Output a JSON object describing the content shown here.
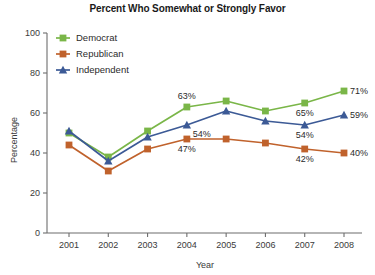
{
  "chart_data": {
    "type": "line",
    "title": "Percent Who Somewhat or Strongly Favor",
    "xlabel": "Year",
    "ylabel": "Percentage",
    "categories": [
      "2001",
      "2002",
      "2003",
      "2004",
      "2005",
      "2006",
      "2007",
      "2008"
    ],
    "x": [
      2001,
      2002,
      2003,
      2004,
      2005,
      2006,
      2007,
      2008
    ],
    "ylim": [
      0,
      100
    ],
    "yticks": [
      0,
      20,
      40,
      60,
      80,
      100
    ],
    "ytick_labels": [
      "0",
      "20",
      "40",
      "60",
      "80",
      "100"
    ],
    "grid": false,
    "legend_position": "upper-left-inside",
    "series": [
      {
        "name": "Democrat",
        "color": "#7ab648",
        "marker": "square",
        "values": [
          50,
          38,
          51,
          63,
          66,
          61,
          65,
          71
        ]
      },
      {
        "name": "Republican",
        "color": "#c0622c",
        "marker": "square",
        "values": [
          44,
          31,
          42,
          47,
          47,
          45,
          42,
          40
        ]
      },
      {
        "name": "Independent",
        "color": "#3c5a96",
        "marker": "triangle",
        "values": [
          51,
          36,
          48,
          54,
          61,
          56,
          54,
          59
        ]
      }
    ],
    "annotations": [
      {
        "text": "63%",
        "series": "Democrat",
        "year": 2004,
        "value": 63,
        "placement": "above"
      },
      {
        "text": "71%",
        "series": "Democrat",
        "year": 2008,
        "value": 71,
        "placement": "right"
      },
      {
        "text": "65%",
        "series": "Democrat",
        "year": 2007,
        "value": 65,
        "placement": "below"
      },
      {
        "text": "54%",
        "series": "Independent",
        "year": 2004,
        "value": 54,
        "placement": "below-right"
      },
      {
        "text": "59%",
        "series": "Independent",
        "year": 2008,
        "value": 59,
        "placement": "right"
      },
      {
        "text": "54%",
        "series": "Independent",
        "year": 2007,
        "value": 54,
        "placement": "below"
      },
      {
        "text": "47%",
        "series": "Republican",
        "year": 2004,
        "value": 47,
        "placement": "below"
      },
      {
        "text": "40%",
        "series": "Republican",
        "year": 2008,
        "value": 40,
        "placement": "right"
      },
      {
        "text": "42%",
        "series": "Republican",
        "year": 2007,
        "value": 42,
        "placement": "below"
      }
    ]
  },
  "legend": {
    "items": [
      {
        "label": "Democrat"
      },
      {
        "label": "Republican"
      },
      {
        "label": "Independent"
      }
    ]
  }
}
